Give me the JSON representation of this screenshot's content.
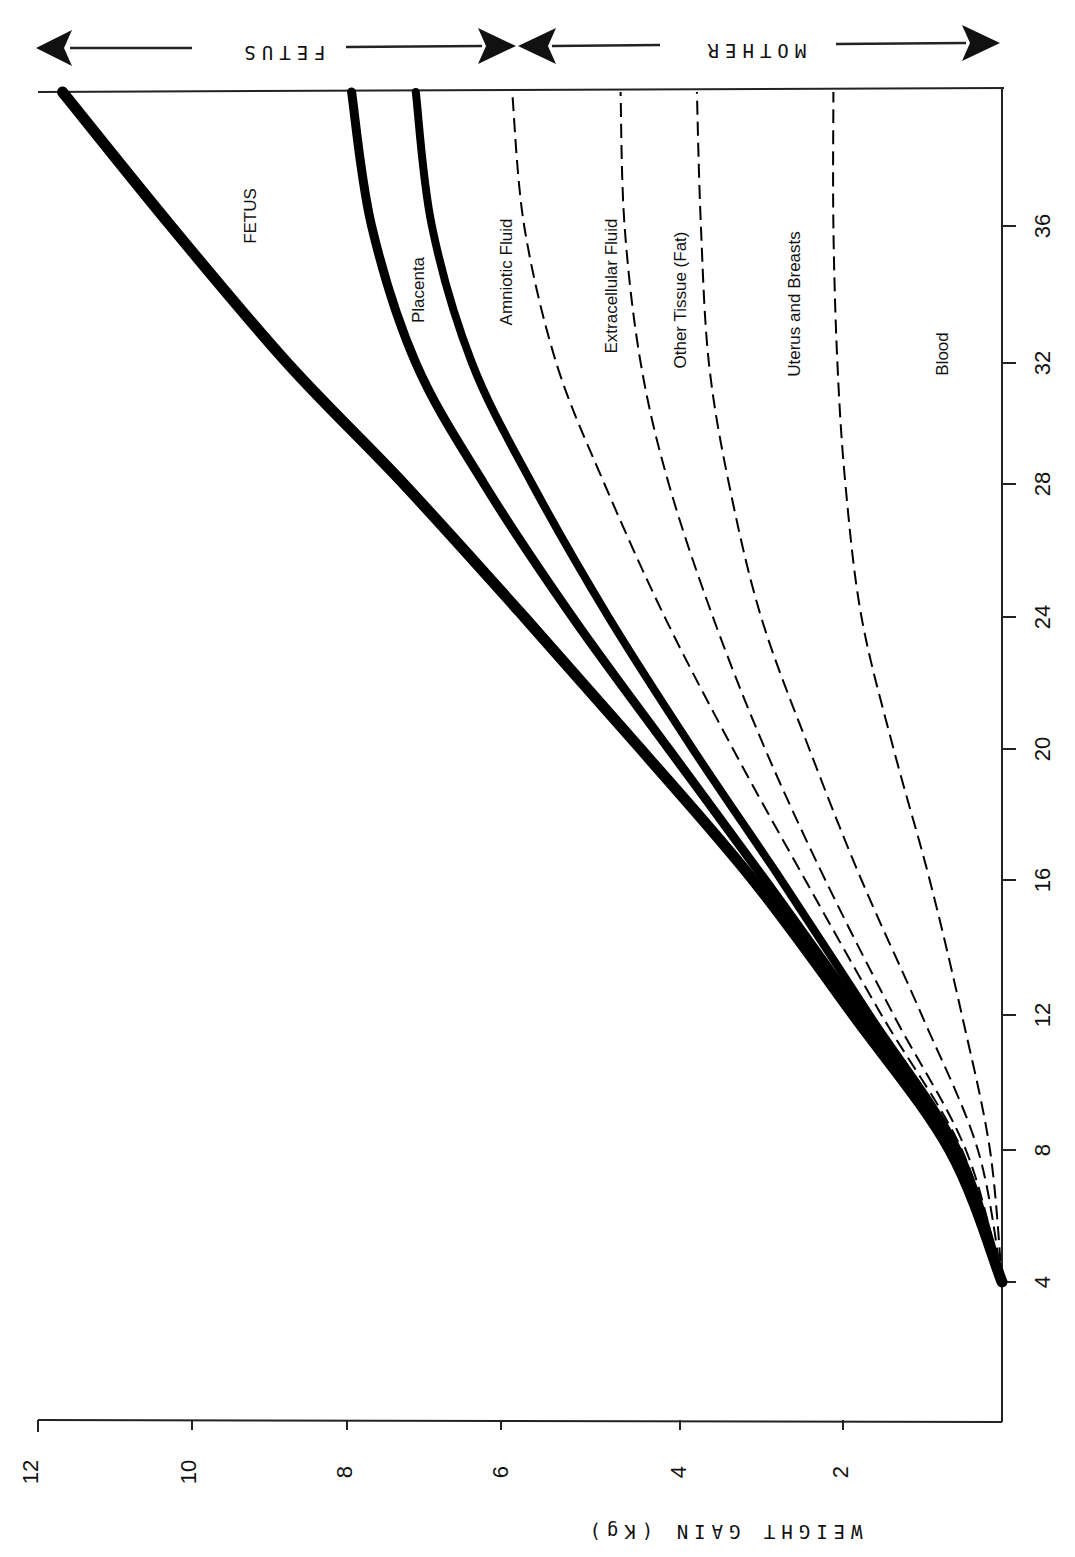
{
  "chart_data": {
    "type": "line",
    "orientation": "rotated-90deg",
    "title": "",
    "xlabel": "Weeks of gestation",
    "ylabel": "WEIGHT GAIN (Kg)",
    "x_ticks": [
      4,
      8,
      12,
      16,
      20,
      24,
      28,
      32,
      36
    ],
    "y_ticks": [
      2,
      4,
      6,
      8,
      10,
      12
    ],
    "xlim": [
      0,
      40
    ],
    "ylim": [
      0,
      12
    ],
    "grid": false,
    "stacked_cumulative": true,
    "x": [
      4,
      8,
      12,
      16,
      20,
      24,
      28,
      32,
      36,
      40
    ],
    "series": [
      {
        "name": "Blood",
        "style": "dashed",
        "values": [
          0,
          0.15,
          0.5,
          0.9,
          1.35,
          1.75,
          1.95,
          2.05,
          2.1,
          2.1
        ]
      },
      {
        "name": "Uterus and Breasts",
        "style": "dashed",
        "values": [
          0,
          0.3,
          1.0,
          1.75,
          2.4,
          3.0,
          3.4,
          3.65,
          3.75,
          3.8
        ]
      },
      {
        "name": "Other Tissue (Fat)",
        "style": "dashed",
        "values": [
          0,
          0.45,
          1.35,
          2.2,
          2.95,
          3.6,
          4.15,
          4.5,
          4.7,
          4.75
        ]
      },
      {
        "name": "Extracellular Fluid",
        "style": "dashed",
        "values": [
          0,
          0.5,
          1.5,
          2.45,
          3.35,
          4.2,
          4.95,
          5.55,
          5.95,
          6.1
        ]
      },
      {
        "name": "Amniotic Fluid",
        "style": "solid",
        "values": [
          0,
          0.55,
          1.65,
          2.75,
          3.85,
          4.9,
          5.85,
          6.6,
          7.1,
          7.3
        ]
      },
      {
        "name": "Placenta",
        "style": "solid",
        "values": [
          0,
          0.6,
          1.75,
          2.95,
          4.15,
          5.35,
          6.45,
          7.3,
          7.85,
          8.1
        ]
      },
      {
        "name": "FETUS",
        "style": "solid",
        "values": [
          0,
          0.65,
          1.85,
          3.1,
          4.5,
          5.95,
          7.45,
          8.9,
          10.35,
          11.7
        ]
      }
    ],
    "band_labels": {
      "fetus": "FETUS",
      "mother": "MOTHER"
    }
  },
  "labels": {
    "axis_title": "WEIGHT GAIN (Kg)",
    "week_ticks": [
      "4",
      "8",
      "12",
      "16",
      "20",
      "24",
      "28",
      "32",
      "36"
    ],
    "kg_ticks": [
      "12",
      "10",
      "8",
      "6",
      "4",
      "2"
    ],
    "fetus_band": "FETUS",
    "mother_band": "MOTHER",
    "curve_fetus": "FETUS",
    "curve_placenta": "Placenta",
    "curve_amniotic": "Amniotic Fluid",
    "curve_extracellular": "Extracellular Fluid",
    "curve_other": "Other Tissue (Fat)",
    "curve_uterus": "Uterus and Breasts",
    "curve_blood": "Blood"
  }
}
